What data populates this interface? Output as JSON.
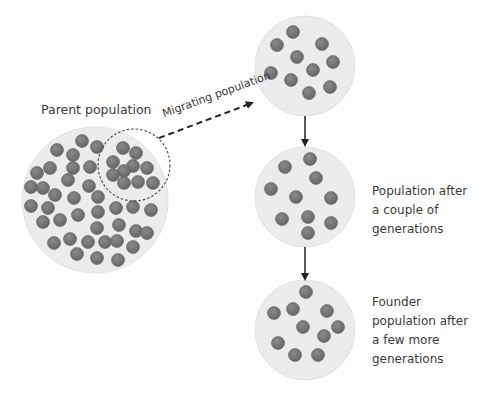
{
  "labels": {
    "parent": "Parent population",
    "migrating": "Migrating population",
    "after_couple": [
      "Population after",
      "a couple of",
      "generations"
    ],
    "founder": [
      "Founder",
      "population after",
      "a few more",
      "generations"
    ]
  },
  "colors": {
    "population_fill": "#ececec",
    "individual_fill": "#7b7b7b",
    "individual_stroke": "#5f5f5f",
    "arrow": "#222222",
    "text": "#3a3a3a"
  },
  "populations": [
    {
      "id": "parent",
      "cx": 95,
      "cy": 200,
      "r": 73,
      "individuals": [
        [
          82,
          141
        ],
        [
          97,
          147
        ],
        [
          57,
          150
        ],
        [
          73,
          155
        ],
        [
          50,
          168
        ],
        [
          73,
          168
        ],
        [
          90,
          167
        ],
        [
          37,
          173
        ],
        [
          68,
          180
        ],
        [
          31,
          187
        ],
        [
          43,
          188
        ],
        [
          89,
          186
        ],
        [
          55,
          195
        ],
        [
          74,
          198
        ],
        [
          98,
          197
        ],
        [
          31,
          206
        ],
        [
          48,
          208
        ],
        [
          43,
          222
        ],
        [
          60,
          220
        ],
        [
          78,
          215
        ],
        [
          98,
          212
        ],
        [
          116,
          208
        ],
        [
          133,
          207
        ],
        [
          151,
          210
        ],
        [
          97,
          228
        ],
        [
          119,
          225
        ],
        [
          136,
          231
        ],
        [
          147,
          233
        ],
        [
          54,
          243
        ],
        [
          70,
          239
        ],
        [
          88,
          242
        ],
        [
          105,
          242
        ],
        [
          117,
          241
        ],
        [
          133,
          247
        ],
        [
          77,
          254
        ],
        [
          97,
          258
        ],
        [
          118,
          260
        ]
      ]
    },
    {
      "id": "migrating",
      "cx": 134,
      "cy": 165,
      "r": 36,
      "individuals": [
        [
          123,
          148
        ],
        [
          136,
          153
        ],
        [
          113,
          162
        ],
        [
          133,
          166
        ],
        [
          124,
          171
        ],
        [
          147,
          168
        ],
        [
          113,
          175
        ],
        [
          124,
          183
        ],
        [
          138,
          182
        ],
        [
          153,
          183
        ]
      ]
    },
    {
      "id": "founder-initial",
      "cx": 305,
      "cy": 66,
      "r": 50,
      "individuals": [
        [
          293,
          32
        ],
        [
          277,
          45
        ],
        [
          322,
          44
        ],
        [
          297,
          57
        ],
        [
          333,
          62
        ],
        [
          313,
          70
        ],
        [
          271,
          73
        ],
        [
          291,
          80
        ],
        [
          330,
          87
        ],
        [
          309,
          93
        ]
      ]
    },
    {
      "id": "after-couple-generations",
      "cx": 305,
      "cy": 197,
      "r": 50,
      "individuals": [
        [
          310,
          159
        ],
        [
          285,
          167
        ],
        [
          316,
          178
        ],
        [
          271,
          189
        ],
        [
          296,
          197
        ],
        [
          331,
          198
        ],
        [
          282,
          219
        ],
        [
          308,
          217
        ],
        [
          331,
          223
        ],
        [
          308,
          233
        ]
      ]
    },
    {
      "id": "after-few-more-generations",
      "cx": 305,
      "cy": 330,
      "r": 50,
      "individuals": [
        [
          306,
          292
        ],
        [
          274,
          313
        ],
        [
          293,
          309
        ],
        [
          327,
          311
        ],
        [
          303,
          327
        ],
        [
          338,
          327
        ],
        [
          324,
          336
        ],
        [
          278,
          343
        ],
        [
          295,
          355
        ],
        [
          318,
          355
        ]
      ]
    }
  ],
  "arrows": [
    {
      "id": "migration-arrow",
      "style": "dashed",
      "from": [
        159,
        138
      ],
      "to": [
        252,
        103
      ]
    },
    {
      "id": "generation-arrow-1",
      "style": "solid",
      "from": [
        305,
        116
      ],
      "to": [
        305,
        145
      ]
    },
    {
      "id": "generation-arrow-2",
      "style": "solid",
      "from": [
        305,
        247
      ],
      "to": [
        305,
        279
      ]
    }
  ]
}
